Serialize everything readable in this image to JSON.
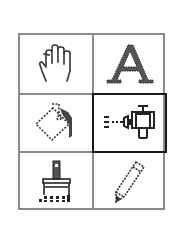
{
  "palette": {
    "title": "Tool palette",
    "selected_tool": "spray",
    "colors": {
      "grid": "#8a8a8a",
      "selected_border": "#1a1a1a",
      "icon": "#222222",
      "icon_gray": "#555555",
      "background": "#ffffff"
    },
    "tools": [
      {
        "id": "hand",
        "icon": "hand-icon",
        "row": 0,
        "col": 0,
        "selected": false
      },
      {
        "id": "text",
        "icon": "text-a-icon",
        "row": 0,
        "col": 1,
        "selected": false
      },
      {
        "id": "paint-bucket",
        "icon": "paint-bucket-icon",
        "row": 1,
        "col": 0,
        "selected": false
      },
      {
        "id": "spray",
        "icon": "spray-can-icon",
        "row": 1,
        "col": 1,
        "selected": true
      },
      {
        "id": "brush",
        "icon": "paintbrush-icon",
        "row": 2,
        "col": 0,
        "selected": false
      },
      {
        "id": "pencil",
        "icon": "pencil-icon",
        "row": 2,
        "col": 1,
        "selected": false
      }
    ]
  }
}
